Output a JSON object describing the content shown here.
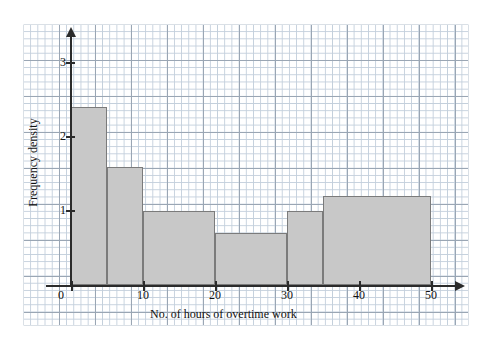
{
  "chart_data": {
    "type": "bar",
    "title": "",
    "subtitle": "",
    "xlabel": "No. of hours of overtime work",
    "ylabel": "Frequency density",
    "grid": true,
    "legend": false,
    "xlim": [
      0,
      50
    ],
    "ylim": [
      0,
      3.4
    ],
    "xticks": [
      0,
      10,
      20,
      30,
      40,
      50
    ],
    "xtick_labels": [
      "0",
      "10",
      "20",
      "30",
      "40",
      "50"
    ],
    "yticks": [
      1,
      2,
      3
    ],
    "ytick_labels": [
      "1",
      "2",
      "3"
    ],
    "bin_edges": [
      0,
      5,
      10,
      20,
      30,
      35,
      50
    ],
    "values": [
      2.4,
      1.6,
      1.0,
      0.7,
      1.0,
      1.2
    ],
    "bars": [
      {
        "label": "0-5",
        "x_start": 0,
        "x_end": 5,
        "value": 2.4
      },
      {
        "label": "5-10",
        "x_start": 5,
        "x_end": 10,
        "value": 1.6
      },
      {
        "label": "10-20",
        "x_start": 10,
        "x_end": 20,
        "value": 1.0
      },
      {
        "label": "20-30",
        "x_start": 20,
        "x_end": 30,
        "value": 0.7
      },
      {
        "label": "30-35",
        "x_start": 30,
        "x_end": 35,
        "value": 1.0
      },
      {
        "label": "35-50",
        "x_start": 35,
        "x_end": 50,
        "value": 1.2
      }
    ],
    "colors": {
      "bar_fill": "#c8c8c8",
      "bar_edge": "#7b7b7b",
      "axis": "#2b2b2b",
      "grid_minor": "#c3cfdc",
      "grid_major": "#9aa6b4",
      "background": "#ffffff"
    }
  }
}
